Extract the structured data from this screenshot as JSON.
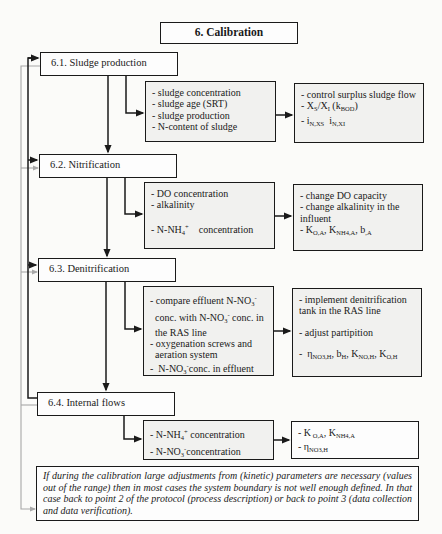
{
  "title": "6. Calibration",
  "sections": [
    {
      "id": "6.1",
      "heading": "6.1. Sludge production",
      "checks": [
        "- sludge concentration",
        "- sludge age (SRT)",
        "- sludge production",
        "- N-content of sludge"
      ],
      "actions": {
        "line1": "- control surplus sludge flow",
        "line2_prefix": "- X",
        "line2_sub1": "S",
        "line2_mid": "/X",
        "line2_sub2": "I",
        "line2_paren_open": " (k",
        "line2_sub3": "BOD",
        "line2_paren_close": ")",
        "line3_prefix": "- i",
        "line3_sub1": "N,XS",
        "line3_mid": "  i",
        "line3_sub2": "N,XI"
      }
    },
    {
      "id": "6.2",
      "heading": "6.2. Nitrification",
      "checks": {
        "line1": "- DO concentration",
        "line2": "- alkalinity",
        "line3_prefix": "- N-NH",
        "line3_sub": "4",
        "line3_sup": "+",
        "line3_suffix": "    concentration"
      },
      "actions": {
        "line1": "- change DO capacity",
        "line2": "- change alkalinity in the influent",
        "line3_prefix": "- K",
        "line3_sub1": "O,A",
        "line3_sep1": ", K",
        "line3_sub2": "NH4,A",
        "line3_sep2": ", b",
        "line3_sub3": ",A"
      }
    },
    {
      "id": "6.3",
      "heading": "6.3. Denitrification",
      "checks": {
        "line1_prefix": "- compare effluent N-NO",
        "line1_sub": "3",
        "line1_sup": "-",
        "line2_prefix": "conc. with N-NO",
        "line2_sub": "3",
        "line2_sup": "-",
        "line2_suffix": " conc. in",
        "line3": "the RAS line",
        "line4": "- oxygenation screws and",
        "line5": "aeration system",
        "line6_prefix": "-  N-NO",
        "line6_sub": "3",
        "line6_sup": "-",
        "line6_suffix": "conc. in effluent"
      },
      "actions": {
        "line1": "- implement denitrification tank in the RAS line",
        "line2": "- adjust partipition",
        "line3_prefix": "-  η",
        "line3_sub1": "NO3,H",
        "line3_sep1": ", b",
        "line3_sub2": "H",
        "line3_sep2": ", K",
        "line3_sub3": "NO,H",
        "line3_sep3": ", K",
        "line3_sub4": "O,H"
      }
    },
    {
      "id": "6.4",
      "heading": "6.4. Internal flows",
      "checks": {
        "line1_prefix": "- N-NH",
        "line1_sub": "4",
        "line1_sup": "+",
        "line1_suffix": " concentration",
        "line2_prefix": "- N-NO",
        "line2_sub": "3",
        "line2_sup": "-",
        "line2_suffix": "concentration"
      },
      "actions": {
        "line1_prefix": "- K",
        "line1_sub1": " O,A",
        "line1_sep": ", K",
        "line1_sub2": "NH4,A",
        "line2_prefix": "- η",
        "line2_sub": "NO3,H"
      }
    }
  ],
  "note": "If during the calibration large adjustments from (kinetic) parameters are necessary (values out of the range) then in most cases the system boundary is not well enough defined. In that case back to point 2 of the protocol (process description) or back to point 3 (data collection and data verification).",
  "colors": {
    "line": "#1a1a1a",
    "feedback_line": "#a8a8a8",
    "box_fill": "#f1f1ef",
    "background": "#fbfbf9"
  }
}
